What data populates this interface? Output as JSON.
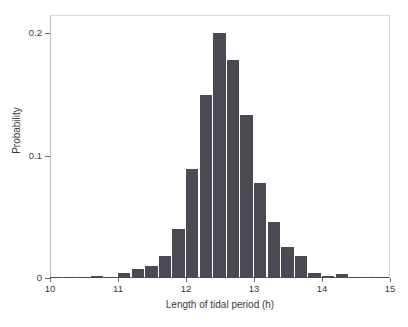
{
  "chart_data": {
    "type": "bar",
    "title": "",
    "subtitle": "",
    "xlabel": "Length of tidal period (h)",
    "ylabel": "Probability",
    "xlim": [
      10,
      15
    ],
    "ylim": [
      0,
      0.215
    ],
    "xticks": [
      10,
      11,
      12,
      13,
      14,
      15
    ],
    "xtick_labels": [
      "10",
      "11",
      "12",
      "13",
      "14",
      "15"
    ],
    "yticks": [
      0,
      0.1,
      0.2
    ],
    "ytick_labels": [
      "0",
      "0.1",
      "0.2"
    ],
    "grid": false,
    "legend": null,
    "bar_color": "#4a4a52",
    "bin_width": 0.2,
    "bin_left_edges": [
      10.0,
      10.2,
      10.4,
      10.6,
      10.8,
      11.0,
      11.2,
      11.4,
      11.6,
      11.8,
      12.0,
      12.2,
      12.4,
      12.6,
      12.8,
      13.0,
      13.2,
      13.4,
      13.6,
      13.8,
      14.0,
      14.2,
      14.4,
      14.6,
      14.8
    ],
    "categories": [
      "10.0",
      "10.2",
      "10.4",
      "10.6",
      "10.8",
      "11.0",
      "11.2",
      "11.4",
      "11.6",
      "11.8",
      "12.0",
      "12.2",
      "12.4",
      "12.6",
      "12.8",
      "13.0",
      "13.2",
      "13.4",
      "13.6",
      "13.8",
      "14.0",
      "14.2",
      "14.4",
      "14.6",
      "14.8"
    ],
    "values": [
      0.001,
      0.001,
      0.001,
      0.002,
      0.001,
      0.004,
      0.007,
      0.01,
      0.018,
      0.04,
      0.089,
      0.15,
      0.2,
      0.178,
      0.133,
      0.078,
      0.046,
      0.025,
      0.018,
      0.004,
      0.002,
      0.003,
      0.001,
      0.001,
      0.001
    ]
  },
  "axes": {
    "y_axis_label": "Probability",
    "x_axis_label": "Length of tidal period (h)"
  }
}
